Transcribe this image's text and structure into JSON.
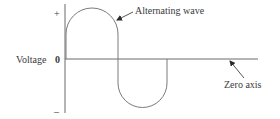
{
  "diagram": {
    "y_axis": {
      "label": "Voltage",
      "ticks": {
        "plus": "+",
        "zero": "0",
        "minus": "–"
      }
    },
    "annotations": {
      "wave_label": "Alternating wave",
      "axis_label": "Zero axis"
    },
    "colors": {
      "line": "#6b6b6b",
      "text": "#3a3a3a",
      "background": "#ffffff"
    }
  }
}
